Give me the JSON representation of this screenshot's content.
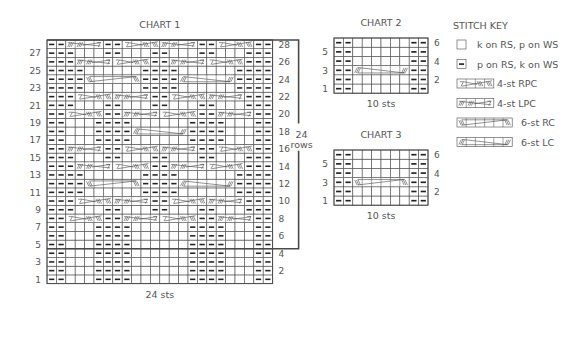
{
  "chart1": {
    "title": "CHART 1",
    "width_label": "24 sts",
    "rows_label_num": "24",
    "rows_label_word": "rows",
    "stitches": 24,
    "repeat_rows": [
      5,
      28
    ],
    "rows": [
      {
        "n": 1,
        "t": [
          "p2",
          "k3",
          "p4",
          "k6",
          "p4",
          "k3",
          "p2"
        ]
      },
      {
        "n": 2,
        "t": [
          "p2",
          "k3",
          "p4",
          "k6",
          "p4",
          "k3",
          "p2"
        ]
      },
      {
        "n": 3,
        "t": [
          "p2",
          "k3",
          "p4",
          "k6",
          "p4",
          "k3",
          "p2"
        ]
      },
      {
        "n": 4,
        "t": [
          "p2",
          "k3",
          "p4",
          "k6",
          "p4",
          "k3",
          "p2"
        ]
      },
      {
        "n": 5,
        "t": [
          "p2",
          "k3",
          "p4",
          "k6",
          "p4",
          "k3",
          "p2"
        ]
      },
      {
        "n": 6,
        "t": [
          "p2",
          "k3",
          "p4",
          "k6",
          "p4",
          "k3",
          "p2"
        ]
      },
      {
        "n": 7,
        "t": [
          "p2",
          "k3",
          "p4",
          "k6",
          "p4",
          "k3",
          "p2"
        ]
      },
      {
        "n": 8,
        "t": [
          "p2",
          "RPC",
          "p2",
          "LPC",
          "RPC",
          "p2",
          "LPC",
          "p2"
        ]
      },
      {
        "n": 9,
        "t": [
          "p3",
          "k3",
          "p2",
          "k3",
          "p2",
          "k3",
          "p2",
          "k3",
          "p3"
        ]
      },
      {
        "n": 10,
        "t": [
          "p3",
          "RPC",
          "LPC",
          "p2",
          "RPC",
          "LPC",
          "p3"
        ]
      },
      {
        "n": 11,
        "t": [
          "p4",
          "k6",
          "p4",
          "k6",
          "p4"
        ]
      },
      {
        "n": 12,
        "t": [
          "p4",
          "RC6",
          "p4",
          "LC6",
          "p4"
        ]
      },
      {
        "n": 13,
        "t": [
          "p4",
          "k6",
          "p4",
          "k6",
          "p4"
        ]
      },
      {
        "n": 14,
        "t": [
          "p3",
          "LPC",
          "RPC",
          "p2",
          "LPC",
          "RPC",
          "p3"
        ]
      },
      {
        "n": 15,
        "t": [
          "p3",
          "k3",
          "p2",
          "k3",
          "p2",
          "k3",
          "p2",
          "k3",
          "p3"
        ]
      },
      {
        "n": 16,
        "t": [
          "p2",
          "LPC",
          "p2",
          "RPC",
          "LPC",
          "p2",
          "RPC",
          "p2"
        ]
      },
      {
        "n": 17,
        "t": [
          "p2",
          "k3",
          "p4",
          "k6",
          "p4",
          "k3",
          "p2"
        ]
      },
      {
        "n": 18,
        "t": [
          "p2",
          "k3",
          "p4",
          "LC6",
          "p4",
          "k3",
          "p2"
        ]
      },
      {
        "n": 19,
        "t": [
          "p2",
          "k3",
          "p4",
          "k6",
          "p4",
          "k3",
          "p2"
        ]
      },
      {
        "n": 20,
        "t": [
          "p2",
          "RPC",
          "p2",
          "LPC",
          "RPC",
          "p2",
          "LPC",
          "p2"
        ]
      },
      {
        "n": 21,
        "t": [
          "p3",
          "k3",
          "p2",
          "k3",
          "p2",
          "k3",
          "p2",
          "k3",
          "p3"
        ]
      },
      {
        "n": 22,
        "t": [
          "p3",
          "RPC",
          "LPC",
          "p2",
          "RPC",
          "LPC",
          "p3"
        ]
      },
      {
        "n": 23,
        "t": [
          "p4",
          "k6",
          "p4",
          "k6",
          "p4"
        ]
      },
      {
        "n": 24,
        "t": [
          "p4",
          "RC6",
          "p4",
          "LC6",
          "p4"
        ]
      },
      {
        "n": 25,
        "t": [
          "p4",
          "k6",
          "p4",
          "k6",
          "p4"
        ]
      },
      {
        "n": 26,
        "t": [
          "p3",
          "LPC",
          "RPC",
          "p2",
          "LPC",
          "RPC",
          "p3"
        ]
      },
      {
        "n": 27,
        "t": [
          "p3",
          "k3",
          "p2",
          "k3",
          "p2",
          "k3",
          "p2",
          "k3",
          "p3"
        ]
      },
      {
        "n": 28,
        "t": [
          "p2",
          "LPC",
          "p2",
          "RPC",
          "LPC",
          "p2",
          "RPC",
          "p2"
        ]
      }
    ]
  },
  "chart2": {
    "title": "CHART 2",
    "width_label": "10 sts",
    "stitches": 10,
    "rows": [
      {
        "n": 1,
        "t": [
          "p2",
          "k6",
          "p2"
        ]
      },
      {
        "n": 2,
        "t": [
          "p2",
          "k6",
          "p2"
        ]
      },
      {
        "n": 3,
        "t": [
          "p2",
          "LC6",
          "p2"
        ]
      },
      {
        "n": 4,
        "t": [
          "p2",
          "k6",
          "p2"
        ]
      },
      {
        "n": 5,
        "t": [
          "p2",
          "k6",
          "p2"
        ]
      },
      {
        "n": 6,
        "t": [
          "p2",
          "k6",
          "p2"
        ]
      }
    ]
  },
  "chart3": {
    "title": "CHART 3",
    "width_label": "10 sts",
    "stitches": 10,
    "rows": [
      {
        "n": 1,
        "t": [
          "p2",
          "k6",
          "p2"
        ]
      },
      {
        "n": 2,
        "t": [
          "p2",
          "k6",
          "p2"
        ]
      },
      {
        "n": 3,
        "t": [
          "p2",
          "RC6",
          "p2"
        ]
      },
      {
        "n": 4,
        "t": [
          "p2",
          "k6",
          "p2"
        ]
      },
      {
        "n": 5,
        "t": [
          "p2",
          "k6",
          "p2"
        ]
      },
      {
        "n": 6,
        "t": [
          "p2",
          "k6",
          "p2"
        ]
      }
    ]
  },
  "key": {
    "title": "STITCH KEY",
    "items": [
      {
        "sym": "k",
        "label": "k on RS, p on WS"
      },
      {
        "sym": "p",
        "label": "p on RS, k on WS"
      },
      {
        "sym": "RPC",
        "label": "4-st RPC"
      },
      {
        "sym": "LPC",
        "label": "4-st LPC"
      },
      {
        "sym": "RC6",
        "label": "6-st RC"
      },
      {
        "sym": "LC6",
        "label": "6-st LC"
      }
    ]
  },
  "colors": {
    "grid": "#4a4a4a",
    "text": "#555555",
    "purl": "#222222"
  }
}
